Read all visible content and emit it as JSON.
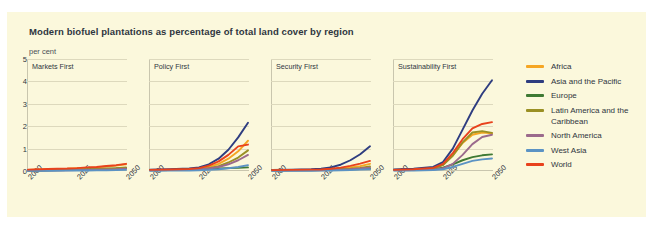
{
  "card": {
    "title": "Modern biofuel plantations as percentage of total land cover by region",
    "units": "per cent"
  },
  "chart_data": {
    "type": "line",
    "title": "Modern biofuel plantations as percentage of total land cover by region",
    "ylabel": "per cent",
    "xlabel": "",
    "ylim": [
      0,
      5
    ],
    "xlim": [
      2000,
      2050
    ],
    "yticks": [
      "0",
      "1",
      "2",
      "3",
      "4",
      "5"
    ],
    "xticks": [
      "2000",
      "2025",
      "2050"
    ],
    "grid": true,
    "legend_position": "right",
    "x": [
      2000,
      2010,
      2020,
      2025,
      2030,
      2035,
      2040,
      2045,
      2050
    ],
    "colors": {
      "Africa": "#f5a623",
      "Asia and the Pacific": "#2e3d80",
      "Europe": "#3f7a34",
      "Latin America and the Caribbean": "#9a9024",
      "North America": "#9b6a8c",
      "West Asia": "#5b93c4",
      "World": "#e8421d"
    },
    "panels": [
      {
        "name": "Markets First",
        "series": [
          {
            "name": "Africa",
            "values": [
              0.05,
              0.08,
              0.1,
              0.12,
              0.14,
              0.16,
              0.2,
              0.24,
              0.3
            ]
          },
          {
            "name": "Asia and the Pacific",
            "values": [
              0.02,
              0.03,
              0.04,
              0.05,
              0.06,
              0.07,
              0.08,
              0.1,
              0.12
            ]
          },
          {
            "name": "Europe",
            "values": [
              0.02,
              0.03,
              0.04,
              0.05,
              0.06,
              0.07,
              0.09,
              0.11,
              0.14
            ]
          },
          {
            "name": "Latin America and the Caribbean",
            "values": [
              0.03,
              0.04,
              0.05,
              0.06,
              0.07,
              0.09,
              0.11,
              0.13,
              0.16
            ]
          },
          {
            "name": "North America",
            "values": [
              0.02,
              0.03,
              0.03,
              0.04,
              0.05,
              0.06,
              0.07,
              0.08,
              0.1
            ]
          },
          {
            "name": "West Asia",
            "values": [
              0.01,
              0.01,
              0.02,
              0.02,
              0.02,
              0.03,
              0.03,
              0.04,
              0.05
            ]
          },
          {
            "name": "World",
            "values": [
              0.06,
              0.09,
              0.11,
              0.13,
              0.16,
              0.18,
              0.22,
              0.26,
              0.32
            ]
          }
        ]
      },
      {
        "name": "Policy First",
        "series": [
          {
            "name": "Africa",
            "values": [
              0.04,
              0.05,
              0.07,
              0.1,
              0.18,
              0.32,
              0.55,
              0.88,
              1.35
            ]
          },
          {
            "name": "Asia and the Pacific",
            "values": [
              0.06,
              0.08,
              0.11,
              0.16,
              0.3,
              0.55,
              0.95,
              1.5,
              2.15
            ]
          },
          {
            "name": "Europe",
            "values": [
              0.04,
              0.05,
              0.07,
              0.08,
              0.1,
              0.11,
              0.13,
              0.14,
              0.16
            ]
          },
          {
            "name": "Latin America and the Caribbean",
            "values": [
              0.03,
              0.04,
              0.06,
              0.08,
              0.13,
              0.22,
              0.38,
              0.6,
              0.92
            ]
          },
          {
            "name": "North America",
            "values": [
              0.03,
              0.04,
              0.05,
              0.07,
              0.11,
              0.18,
              0.3,
              0.48,
              0.72
            ]
          },
          {
            "name": "West Asia",
            "values": [
              0.01,
              0.02,
              0.02,
              0.03,
              0.05,
              0.08,
              0.12,
              0.18,
              0.26
            ]
          },
          {
            "name": "World",
            "values": [
              0.05,
              0.07,
              0.09,
              0.13,
              0.24,
              0.43,
              0.72,
              1.1,
              1.18
            ]
          }
        ]
      },
      {
        "name": "Security First",
        "series": [
          {
            "name": "Africa",
            "values": [
              0.03,
              0.04,
              0.05,
              0.06,
              0.08,
              0.11,
              0.16,
              0.22,
              0.32
            ]
          },
          {
            "name": "Asia and the Pacific",
            "values": [
              0.05,
              0.06,
              0.08,
              0.1,
              0.16,
              0.28,
              0.48,
              0.75,
              1.1
            ]
          },
          {
            "name": "Europe",
            "values": [
              0.03,
              0.04,
              0.04,
              0.05,
              0.06,
              0.07,
              0.08,
              0.09,
              0.1
            ]
          },
          {
            "name": "Latin America and the Caribbean",
            "values": [
              0.02,
              0.03,
              0.03,
              0.04,
              0.05,
              0.07,
              0.1,
              0.14,
              0.2
            ]
          },
          {
            "name": "North America",
            "values": [
              0.02,
              0.02,
              0.03,
              0.03,
              0.04,
              0.06,
              0.08,
              0.11,
              0.15
            ]
          },
          {
            "name": "West Asia",
            "values": [
              0.01,
              0.01,
              0.01,
              0.02,
              0.02,
              0.03,
              0.04,
              0.06,
              0.08
            ]
          },
          {
            "name": "World",
            "values": [
              0.04,
              0.05,
              0.06,
              0.07,
              0.1,
              0.15,
              0.23,
              0.33,
              0.45
            ]
          }
        ]
      },
      {
        "name": "Sustainability First",
        "series": [
          {
            "name": "Africa",
            "values": [
              0.05,
              0.07,
              0.12,
              0.28,
              0.7,
              1.25,
              1.62,
              1.72,
              1.68
            ]
          },
          {
            "name": "Asia and the Pacific",
            "values": [
              0.07,
              0.1,
              0.18,
              0.4,
              1.0,
              1.85,
              2.7,
              3.45,
              4.05
            ]
          },
          {
            "name": "Europe",
            "values": [
              0.04,
              0.05,
              0.08,
              0.15,
              0.3,
              0.48,
              0.62,
              0.7,
              0.74
            ]
          },
          {
            "name": "Latin America and the Caribbean",
            "values": [
              0.04,
              0.06,
              0.11,
              0.26,
              0.68,
              1.28,
              1.72,
              1.78,
              1.7
            ]
          },
          {
            "name": "North America",
            "values": [
              0.03,
              0.04,
              0.06,
              0.12,
              0.32,
              0.72,
              1.2,
              1.52,
              1.62
            ]
          },
          {
            "name": "West Asia",
            "values": [
              0.02,
              0.02,
              0.04,
              0.08,
              0.18,
              0.32,
              0.45,
              0.52,
              0.56
            ]
          },
          {
            "name": "World",
            "values": [
              0.05,
              0.08,
              0.14,
              0.32,
              0.8,
              1.42,
              1.9,
              2.1,
              2.18
            ]
          }
        ]
      }
    ]
  },
  "legend": {
    "items": [
      {
        "label": "Africa",
        "color": "#f5a623"
      },
      {
        "label": "Asia and the Pacific",
        "color": "#2e3d80"
      },
      {
        "label": "Europe",
        "color": "#3f7a34"
      },
      {
        "label": "Latin America and the Caribbean",
        "color": "#9a9024"
      },
      {
        "label": "North America",
        "color": "#9b6a8c"
      },
      {
        "label": "West Asia",
        "color": "#5b93c4"
      },
      {
        "label": "World",
        "color": "#e8421d"
      }
    ]
  }
}
